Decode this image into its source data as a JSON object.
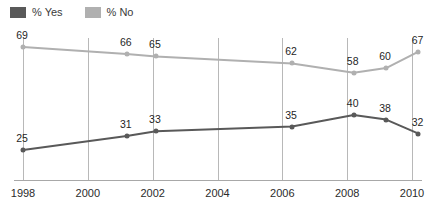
{
  "legend": {
    "entries": [
      {
        "label": "% Yes",
        "color": "#595959",
        "swatch_name": "legend-swatch-yes"
      },
      {
        "label": "% No",
        "color": "#b0b0b0",
        "swatch_name": "legend-swatch-no"
      }
    ]
  },
  "axis": {
    "x_tick_labels": [
      "1998",
      "2000",
      "2002",
      "2004",
      "2006",
      "2008",
      "2010"
    ]
  },
  "chart_data": {
    "type": "line",
    "title": "",
    "subtitle": "",
    "xlabel": "",
    "ylabel": "",
    "xlim": [
      1998,
      2010.6
    ],
    "ylim": [
      0,
      100
    ],
    "grid": "vertical",
    "legend_position": "top-left",
    "x_ticks": [
      1998,
      2000,
      2002,
      2004,
      2006,
      2008,
      2010
    ],
    "series": [
      {
        "name": "% No",
        "color": "#b0b0b0",
        "points": [
          {
            "x": 1998.0,
            "y": 69,
            "label": "69"
          },
          {
            "x": 2001.2,
            "y": 66,
            "label": "66"
          },
          {
            "x": 2002.1,
            "y": 65,
            "label": "65"
          },
          {
            "x": 2006.3,
            "y": 62,
            "label": "62"
          },
          {
            "x": 2008.2,
            "y": 58,
            "label": "58"
          },
          {
            "x": 2009.2,
            "y": 60,
            "label": "60"
          },
          {
            "x": 2010.2,
            "y": 67,
            "label": "67"
          }
        ]
      },
      {
        "name": "% Yes",
        "color": "#595959",
        "points": [
          {
            "x": 1998.0,
            "y": 25,
            "label": "25"
          },
          {
            "x": 2001.2,
            "y": 31,
            "label": "31"
          },
          {
            "x": 2002.1,
            "y": 33,
            "label": "33"
          },
          {
            "x": 2006.3,
            "y": 35,
            "label": "35"
          },
          {
            "x": 2008.2,
            "y": 40,
            "label": "40"
          },
          {
            "x": 2009.2,
            "y": 38,
            "label": "38"
          },
          {
            "x": 2010.2,
            "y": 32,
            "label": "32"
          }
        ]
      }
    ]
  }
}
